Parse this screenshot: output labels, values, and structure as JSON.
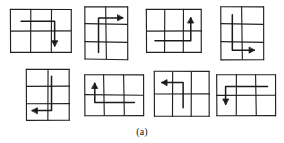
{
  "caption": "(a)",
  "colors": {
    "ink": "#1a1a1a",
    "background": "#ffffff",
    "grid_stroke": "#222222",
    "path_stroke": "#1a1a1a"
  },
  "figure_panel": {
    "label": "(a)",
    "figure_count": 8,
    "rows": 2,
    "columns": 4,
    "description": "Eight hand-drawn rectangular grids, each with an L-shaped arrow path drawn over the cells."
  },
  "figures": [
    {
      "id": "figure-1",
      "index": 1,
      "row": 1,
      "column": 1,
      "grid_cols": 3,
      "grid_rows": 2,
      "orientation": "landscape",
      "x": 10,
      "y": 9,
      "w": 62,
      "h": 44,
      "arrow_direction": "down",
      "path_shape": "right-then-down",
      "path_points": "0.18,0.28 0.72,0.28 0.72,0.84",
      "arrow_at": "0.72,0.84"
    },
    {
      "id": "figure-2",
      "index": 2,
      "row": 1,
      "column": 2,
      "grid_cols": 2,
      "grid_rows": 3,
      "orientation": "portrait",
      "x": 84,
      "y": 6,
      "w": 44,
      "h": 54,
      "arrow_direction": "right",
      "path_shape": "up-then-right",
      "path_points": "0.33,0.86 0.33,0.22 0.88,0.22",
      "arrow_at": "0.88,0.22"
    },
    {
      "id": "figure-3",
      "index": 3,
      "row": 1,
      "column": 3,
      "grid_cols": 3,
      "grid_rows": 2,
      "orientation": "landscape",
      "x": 146,
      "y": 9,
      "w": 56,
      "h": 44,
      "arrow_direction": "up",
      "path_shape": "right-then-up",
      "path_points": "0.16,0.72 0.80,0.72 0.80,0.20",
      "arrow_at": "0.80,0.20"
    },
    {
      "id": "figure-4",
      "index": 4,
      "row": 1,
      "column": 4,
      "grid_cols": 2,
      "grid_rows": 3,
      "orientation": "portrait",
      "x": 220,
      "y": 6,
      "w": 44,
      "h": 54,
      "arrow_direction": "right",
      "path_shape": "down-then-right",
      "path_points": "0.28,0.16 0.28,0.82 0.78,0.82",
      "arrow_at": "0.78,0.82"
    },
    {
      "id": "figure-5",
      "index": 5,
      "row": 2,
      "column": 1,
      "grid_cols": 2,
      "grid_rows": 3,
      "orientation": "portrait",
      "x": 26,
      "y": 69,
      "w": 44,
      "h": 52,
      "arrow_direction": "left",
      "path_shape": "down-then-left",
      "path_points": "0.58,0.14 0.58,0.80 0.14,0.80",
      "arrow_at": "0.14,0.80"
    },
    {
      "id": "figure-6",
      "index": 6,
      "row": 2,
      "column": 2,
      "grid_cols": 3,
      "grid_rows": 2,
      "orientation": "landscape",
      "x": 84,
      "y": 74,
      "w": 60,
      "h": 42,
      "arrow_direction": "up",
      "path_shape": "left-then-up",
      "path_points": "0.84,0.68 0.18,0.68 0.18,0.22",
      "arrow_at": "0.18,0.22"
    },
    {
      "id": "figure-7",
      "index": 7,
      "row": 2,
      "column": 3,
      "grid_cols": 3,
      "grid_rows": 2,
      "orientation": "landscape",
      "x": 154,
      "y": 71,
      "w": 56,
      "h": 46,
      "arrow_direction": "left",
      "path_shape": "up-then-left",
      "path_points": "0.52,0.80 0.52,0.25 0.14,0.25",
      "arrow_at": "0.14,0.25"
    },
    {
      "id": "figure-8",
      "index": 8,
      "row": 2,
      "column": 4,
      "grid_cols": 3,
      "grid_rows": 2,
      "orientation": "landscape",
      "x": 216,
      "y": 74,
      "w": 60,
      "h": 42,
      "arrow_direction": "down",
      "path_shape": "left-then-down",
      "path_points": "0.86,0.30 0.16,0.30 0.16,0.72",
      "arrow_at": "0.16,0.72"
    }
  ]
}
